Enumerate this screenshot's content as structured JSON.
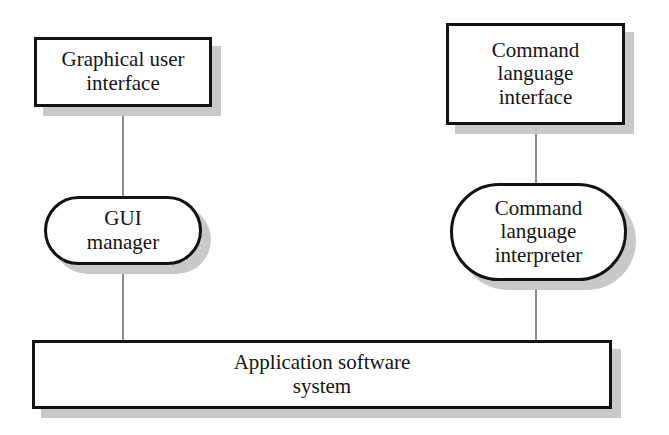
{
  "diagram": {
    "background_color": "#ffffff",
    "border_color": "#121212",
    "shadow_color": "#c9c9c9",
    "connector_color": "#8d8d8d",
    "nodes": [
      {
        "id": "gui-box",
        "label": "Graphical user\ninterface",
        "shape": "rectangle"
      },
      {
        "id": "cli-box",
        "label": "Command\nlanguage\ninterface",
        "shape": "rectangle"
      },
      {
        "id": "gui-mgr",
        "label": "GUI\nmanager",
        "shape": "stadium"
      },
      {
        "id": "cli-interp",
        "label": "Command\nlanguage\ninterpreter",
        "shape": "stadium"
      },
      {
        "id": "app-bar",
        "label": "Application software\nsystem",
        "shape": "rectangle"
      }
    ],
    "connectors": [
      {
        "id": "conn-left-top",
        "from": "gui-box",
        "to": "gui-mgr"
      },
      {
        "id": "conn-left-bottom",
        "from": "gui-mgr",
        "to": "app-bar"
      },
      {
        "id": "conn-right-top",
        "from": "cli-box",
        "to": "cli-interp"
      },
      {
        "id": "conn-right-bottom",
        "from": "cli-interp",
        "to": "app-bar"
      }
    ]
  }
}
